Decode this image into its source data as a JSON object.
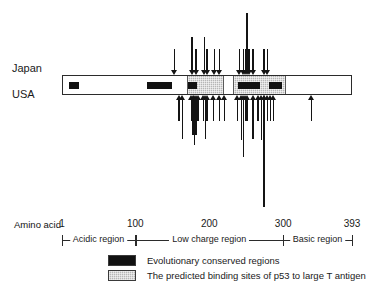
{
  "labels": {
    "japan": "Japan",
    "usa": "USA",
    "amino_acid": "Amino acid"
  },
  "chart_data": {
    "type": "diagram",
    "xlabel": "Amino acid",
    "axis": {
      "start": 1,
      "end": 393,
      "ticks": [
        1,
        100,
        200,
        300,
        393
      ]
    },
    "tick_labels": [
      "1",
      "100",
      "200",
      "300",
      "393"
    ],
    "regions": [
      {
        "name": "Acidic region",
        "start": 1,
        "end": 100
      },
      {
        "name": "Low charge region",
        "start": 100,
        "end": 300
      },
      {
        "name": "Basic region",
        "start": 300,
        "end": 393
      }
    ],
    "conserved_regions": [
      {
        "start": 9,
        "end": 22
      },
      {
        "start": 114,
        "end": 148
      },
      {
        "start": 170,
        "end": 182
      },
      {
        "start": 237,
        "end": 267
      },
      {
        "start": 280,
        "end": 297
      }
    ],
    "predicted_binding_sites": [
      {
        "start": 168,
        "end": 218
      },
      {
        "start": 231,
        "end": 303
      }
    ],
    "series": [
      {
        "name": "Japan",
        "direction": "down",
        "mutations": [
          152,
          176,
          181,
          193,
          196,
          206,
          213,
          240,
          245,
          248,
          250,
          253,
          258,
          273,
          278
        ]
      },
      {
        "name": "USA",
        "direction": "up",
        "mutations": [
          158,
          163,
          175,
          177,
          179,
          181,
          184,
          191,
          194,
          196,
          205,
          213,
          220,
          237,
          243,
          245,
          248,
          250,
          258,
          265,
          270,
          273,
          278,
          282,
          286,
          337
        ]
      }
    ]
  },
  "legend": {
    "items": [
      {
        "swatch": "black",
        "label": "Evolutionary conserved regions"
      },
      {
        "swatch": "gray",
        "label": "The predicted binding sites of p53 to large T antigen"
      }
    ]
  }
}
